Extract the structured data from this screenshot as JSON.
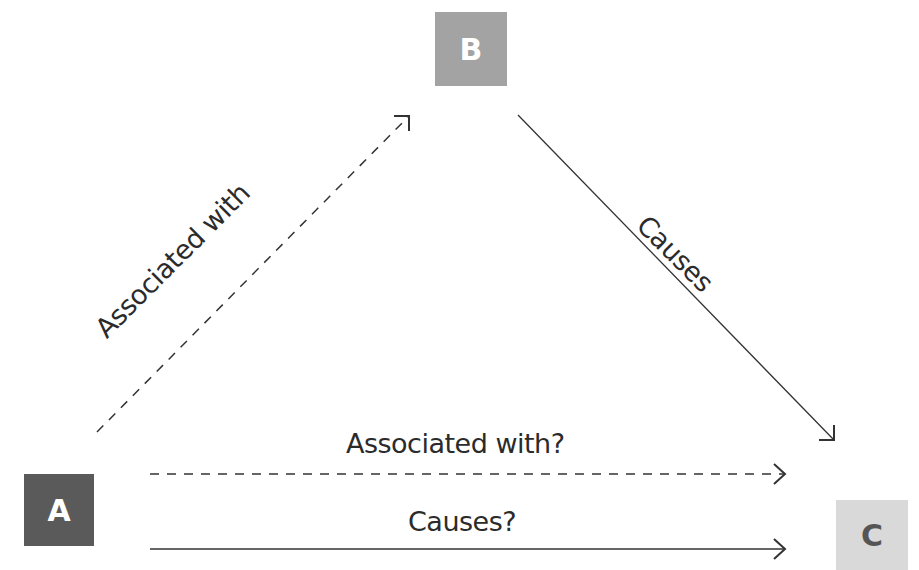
{
  "diagram": {
    "type": "causal-triangle",
    "nodes": [
      {
        "id": "A",
        "label": "A",
        "fill": "#5a5a5a",
        "text_color": "#ffffff"
      },
      {
        "id": "B",
        "label": "B",
        "fill": "#a3a3a3",
        "text_color": "#ffffff"
      },
      {
        "id": "C",
        "label": "C",
        "fill": "#d9d9d9",
        "text_color": "#555555"
      }
    ],
    "edges": [
      {
        "from": "A",
        "to": "B",
        "label": "Associated with",
        "style": "dashed"
      },
      {
        "from": "B",
        "to": "C",
        "label": "Causes",
        "style": "solid"
      },
      {
        "from": "A",
        "to": "C",
        "label": "Associated with?",
        "style": "dashed"
      },
      {
        "from": "A",
        "to": "C",
        "label": "Causes?",
        "style": "solid"
      }
    ]
  }
}
